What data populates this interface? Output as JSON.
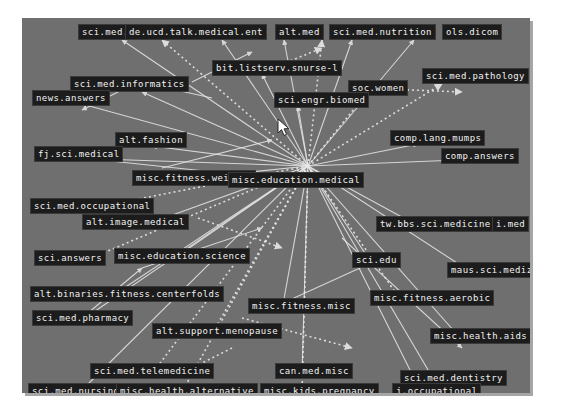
{
  "canvas": {
    "background_color": "#6f6f6f",
    "edge_color": "#e8e8e8",
    "label_bg_color": "#1c1c1c",
    "label_text_color": "#f2f2f2",
    "page_background": "#ffffff",
    "width": 508,
    "height": 375
  },
  "hub": {
    "label": "misc.education.medical",
    "x": 286,
    "y": 148
  },
  "cursor": {
    "x": 255,
    "y": 100
  },
  "nodes": [
    {
      "label": "sci.med.",
      "x": 56,
      "y": 6
    },
    {
      "label": "de.ucd.talk.medical.ent",
      "x": 103,
      "y": 6
    },
    {
      "label": "alt.med",
      "x": 253,
      "y": 6
    },
    {
      "label": "sci.med.nutrition",
      "x": 307,
      "y": 6
    },
    {
      "label": "ols.dicom",
      "x": 420,
      "y": 6
    },
    {
      "label": "bit.listserv.snurse-l",
      "x": 190,
      "y": 42
    },
    {
      "label": "sci.med.pathology",
      "x": 400,
      "y": 50
    },
    {
      "label": "sci.med.informatics",
      "x": 48,
      "y": 58
    },
    {
      "label": "soc.women",
      "x": 326,
      "y": 62
    },
    {
      "label": "news.answers",
      "x": 10,
      "y": 72
    },
    {
      "label": "sci.engr.biomed",
      "x": 252,
      "y": 74
    },
    {
      "label": "comp.lang.mumps",
      "x": 368,
      "y": 112
    },
    {
      "label": "alt.fashion",
      "x": 93,
      "y": 114
    },
    {
      "label": "comp.answers",
      "x": 419,
      "y": 130
    },
    {
      "label": "fj.sci.medical",
      "x": 12,
      "y": 128
    },
    {
      "label": "misc.fitness.weights",
      "x": 110,
      "y": 152
    },
    {
      "label": "sci.med.occupational",
      "x": 8,
      "y": 180
    },
    {
      "label": "alt.image.medical",
      "x": 60,
      "y": 196
    },
    {
      "label": "tw.bbs.sci.medicine",
      "x": 354,
      "y": 198
    },
    {
      "label": "i.med",
      "x": 470,
      "y": 198
    },
    {
      "label": "misc.education.science",
      "x": 92,
      "y": 230
    },
    {
      "label": "sci.answers",
      "x": 12,
      "y": 232
    },
    {
      "label": "sci.edu",
      "x": 330,
      "y": 234
    },
    {
      "label": "maus.sci.medizin",
      "x": 425,
      "y": 244
    },
    {
      "label": "alt.binaries.fitness.centerfolds",
      "x": 8,
      "y": 268
    },
    {
      "label": "misc.fitness.aerobic",
      "x": 348,
      "y": 272
    },
    {
      "label": "misc.fitness.misc",
      "x": 226,
      "y": 280
    },
    {
      "label": "sci.med.pharmacy",
      "x": 10,
      "y": 292
    },
    {
      "label": "alt.support.menopause",
      "x": 130,
      "y": 305
    },
    {
      "label": "misc.health.aids",
      "x": 408,
      "y": 310
    },
    {
      "label": "sci.med.telemedicine",
      "x": 68,
      "y": 345
    },
    {
      "label": "can.med.misc",
      "x": 253,
      "y": 345
    },
    {
      "label": "sci.med.dentistry",
      "x": 378,
      "y": 352
    },
    {
      "label": "sci.med.nursing",
      "x": 6,
      "y": 365
    },
    {
      "label": "misc.health.alternative",
      "x": 94,
      "y": 365
    },
    {
      "label": "misc.kids.pregnancy",
      "x": 238,
      "y": 365
    },
    {
      "label": "j.occupational",
      "x": 370,
      "y": 365
    }
  ],
  "edges": [
    {
      "x1": 286,
      "y1": 148,
      "x2": 100,
      "y2": 22,
      "style": "solid"
    },
    {
      "x1": 286,
      "y1": 148,
      "x2": 140,
      "y2": 22,
      "style": "dotted"
    },
    {
      "x1": 286,
      "y1": 148,
      "x2": 200,
      "y2": 22,
      "style": "solid"
    },
    {
      "x1": 286,
      "y1": 148,
      "x2": 262,
      "y2": 22,
      "style": "solid"
    },
    {
      "x1": 286,
      "y1": 148,
      "x2": 300,
      "y2": 22,
      "style": "dotted"
    },
    {
      "x1": 286,
      "y1": 148,
      "x2": 330,
      "y2": 22,
      "style": "solid"
    },
    {
      "x1": 286,
      "y1": 148,
      "x2": 392,
      "y2": 22,
      "style": "solid"
    },
    {
      "x1": 286,
      "y1": 148,
      "x2": 240,
      "y2": 56,
      "style": "solid"
    },
    {
      "x1": 286,
      "y1": 148,
      "x2": 420,
      "y2": 66,
      "style": "dotted"
    },
    {
      "x1": 286,
      "y1": 148,
      "x2": 120,
      "y2": 74,
      "style": "solid"
    },
    {
      "x1": 286,
      "y1": 148,
      "x2": 344,
      "y2": 76,
      "style": "dotted"
    },
    {
      "x1": 286,
      "y1": 148,
      "x2": 60,
      "y2": 86,
      "style": "solid"
    },
    {
      "x1": 286,
      "y1": 148,
      "x2": 276,
      "y2": 88,
      "style": "solid"
    },
    {
      "x1": 286,
      "y1": 148,
      "x2": 396,
      "y2": 126,
      "style": "solid"
    },
    {
      "x1": 286,
      "y1": 148,
      "x2": 130,
      "y2": 128,
      "style": "solid"
    },
    {
      "x1": 286,
      "y1": 148,
      "x2": 436,
      "y2": 142,
      "style": "solid"
    },
    {
      "x1": 286,
      "y1": 148,
      "x2": 48,
      "y2": 140,
      "style": "solid"
    },
    {
      "x1": 286,
      "y1": 148,
      "x2": 170,
      "y2": 160,
      "style": "solid"
    },
    {
      "x1": 286,
      "y1": 148,
      "x2": 70,
      "y2": 190,
      "style": "dotted"
    },
    {
      "x1": 286,
      "y1": 148,
      "x2": 120,
      "y2": 208,
      "style": "solid"
    },
    {
      "x1": 286,
      "y1": 148,
      "x2": 400,
      "y2": 210,
      "style": "solid"
    },
    {
      "x1": 286,
      "y1": 148,
      "x2": 150,
      "y2": 242,
      "style": "solid"
    },
    {
      "x1": 286,
      "y1": 148,
      "x2": 60,
      "y2": 244,
      "style": "dotted"
    },
    {
      "x1": 286,
      "y1": 148,
      "x2": 350,
      "y2": 246,
      "style": "solid"
    },
    {
      "x1": 286,
      "y1": 148,
      "x2": 452,
      "y2": 256,
      "style": "solid"
    },
    {
      "x1": 286,
      "y1": 148,
      "x2": 90,
      "y2": 278,
      "style": "solid"
    },
    {
      "x1": 286,
      "y1": 148,
      "x2": 380,
      "y2": 284,
      "style": "dotted"
    },
    {
      "x1": 286,
      "y1": 148,
      "x2": 260,
      "y2": 292,
      "style": "solid"
    },
    {
      "x1": 286,
      "y1": 148,
      "x2": 60,
      "y2": 302,
      "style": "solid"
    },
    {
      "x1": 286,
      "y1": 148,
      "x2": 190,
      "y2": 316,
      "style": "dotted"
    },
    {
      "x1": 286,
      "y1": 148,
      "x2": 440,
      "y2": 322,
      "style": "solid"
    },
    {
      "x1": 286,
      "y1": 148,
      "x2": 130,
      "y2": 356,
      "style": "dotted"
    },
    {
      "x1": 286,
      "y1": 148,
      "x2": 280,
      "y2": 356,
      "style": "solid"
    },
    {
      "x1": 286,
      "y1": 148,
      "x2": 412,
      "y2": 362,
      "style": "solid"
    },
    {
      "x1": 286,
      "y1": 148,
      "x2": 60,
      "y2": 372,
      "style": "solid"
    },
    {
      "x1": 286,
      "y1": 148,
      "x2": 160,
      "y2": 374,
      "style": "dotted"
    },
    {
      "x1": 286,
      "y1": 148,
      "x2": 280,
      "y2": 374,
      "style": "dotted"
    },
    {
      "x1": 286,
      "y1": 148,
      "x2": 400,
      "y2": 376,
      "style": "solid"
    },
    {
      "x1": 100,
      "y1": 72,
      "x2": 60,
      "y2": 92,
      "style": "solid"
    },
    {
      "x1": 170,
      "y1": 64,
      "x2": 230,
      "y2": 34,
      "style": "solid"
    },
    {
      "x1": 236,
      "y1": 56,
      "x2": 300,
      "y2": 30,
      "style": "dotted"
    },
    {
      "x1": 60,
      "y1": 140,
      "x2": 230,
      "y2": 158,
      "style": "solid"
    },
    {
      "x1": 140,
      "y1": 150,
      "x2": 250,
      "y2": 122,
      "style": "solid"
    },
    {
      "x1": 176,
      "y1": 200,
      "x2": 260,
      "y2": 230,
      "style": "dotted"
    },
    {
      "x1": 120,
      "y1": 250,
      "x2": 240,
      "y2": 210,
      "style": "solid"
    },
    {
      "x1": 340,
      "y1": 70,
      "x2": 440,
      "y2": 74,
      "style": "dotted"
    },
    {
      "x1": 220,
      "y1": 300,
      "x2": 330,
      "y2": 330,
      "style": "dotted"
    },
    {
      "x1": 250,
      "y1": 290,
      "x2": 360,
      "y2": 240,
      "style": "solid"
    },
    {
      "x1": 320,
      "y1": 220,
      "x2": 440,
      "y2": 330,
      "style": "solid"
    },
    {
      "x1": 190,
      "y1": 80,
      "x2": 100,
      "y2": 60,
      "style": "solid"
    },
    {
      "x1": 60,
      "y1": 300,
      "x2": 120,
      "y2": 250,
      "style": "solid"
    },
    {
      "x1": 210,
      "y1": 330,
      "x2": 150,
      "y2": 360,
      "style": "dotted"
    }
  ]
}
